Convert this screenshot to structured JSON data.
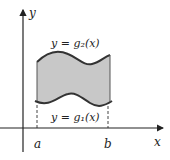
{
  "diagram": {
    "type": "region-between-curves",
    "axes": {
      "x_label": "x",
      "y_label": "y"
    },
    "upper_curve_label": "y = g₂(x)",
    "lower_curve_label": "y = g₁(x)",
    "left_bound_label": "a",
    "right_bound_label": "b",
    "colors": {
      "region_fill": "#c8c8c8",
      "curve": "#333333",
      "axis": "#222222"
    }
  }
}
